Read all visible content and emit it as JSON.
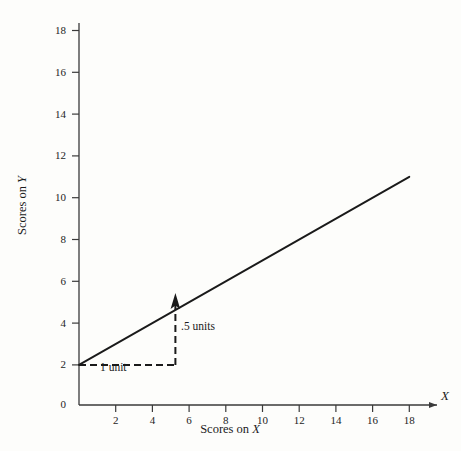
{
  "chart_data": {
    "type": "line",
    "title": "",
    "subtitle": "",
    "xlabel": "Scores on X",
    "ylabel": "Scores on Y",
    "xlim": [
      0,
      19
    ],
    "ylim": [
      0,
      19
    ],
    "grid": false,
    "legend": "none",
    "axis_symbols": {
      "x": "X",
      "y": "Y"
    },
    "xticks": [
      2,
      4,
      6,
      8,
      10,
      12,
      14,
      16,
      18
    ],
    "xtick_labels": [
      "2",
      "4",
      "6",
      "8",
      "10",
      "12",
      "14",
      "16",
      "18"
    ],
    "yticks": [
      0,
      2,
      4,
      6,
      8,
      10,
      12,
      14,
      16,
      18
    ],
    "ytick_labels": [
      "0",
      "2",
      "4",
      "6",
      "8",
      "10",
      "12",
      "14",
      "16",
      "18"
    ],
    "series": [
      {
        "name": "regression line",
        "equation": "Y = 2 + 0.5X",
        "intercept": 2,
        "slope": 0.5,
        "x": [
          0,
          18
        ],
        "values": [
          2,
          11
        ],
        "style": "solid",
        "color": "#1a1a1a"
      }
    ],
    "annotations": [
      {
        "name": "run",
        "label": "1 unit",
        "style": "dashed",
        "from": [
          0,
          2
        ],
        "to": [
          5.8,
          2
        ],
        "orientation": "horizontal"
      },
      {
        "name": "rise",
        "label": ".5 units",
        "style": "dashed-arrow",
        "from": [
          5.8,
          2
        ],
        "to": [
          5.8,
          5.3
        ],
        "orientation": "vertical"
      }
    ]
  },
  "labels": {
    "y_axis_title": "Scores on Y",
    "x_axis_title": "Scores on X",
    "x_axis_symbol": "X",
    "y_axis_symbol": "Y",
    "annotation_run": "1 unit",
    "annotation_rise": ".5 units"
  },
  "colors": {
    "background": "#fdfdfb",
    "axis": "#3a3a3a",
    "line": "#1a1a1a",
    "text": "#242424"
  }
}
